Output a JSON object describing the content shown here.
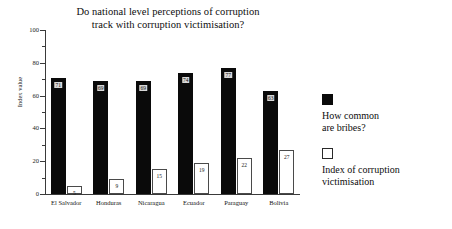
{
  "chart_data": {
    "type": "bar",
    "title": "Do national level perceptions of corruption track with corruption victimisation?",
    "title_lines": [
      "Do national level perceptions of corruption",
      "track with corruption victimisation?"
    ],
    "xlabel": "",
    "ylabel": "Index value",
    "ylim": [
      0,
      100
    ],
    "y_ticks": [
      0,
      20,
      40,
      60,
      80,
      100
    ],
    "y_minor_ticks": [
      10,
      30,
      50,
      70,
      90
    ],
    "grid": false,
    "legend_position": "right",
    "categories": [
      "El Salvador",
      "Honduras",
      "Nicaragua",
      "Ecuador",
      "Paraguay",
      "Bolivia"
    ],
    "series": [
      {
        "name": "How common are bribes?",
        "name_lines": [
          "How common",
          "are bribes?"
        ],
        "color": "#0a0a0a",
        "style": "filled",
        "values": [
          71,
          69,
          69,
          74,
          77,
          63
        ]
      },
      {
        "name": "Index of corruption victimisation",
        "name_lines": [
          "Index of corruption",
          "victimisation"
        ],
        "color": "#ffffff",
        "style": "outlined",
        "values": [
          5,
          9,
          15,
          19,
          22,
          27
        ]
      }
    ]
  }
}
